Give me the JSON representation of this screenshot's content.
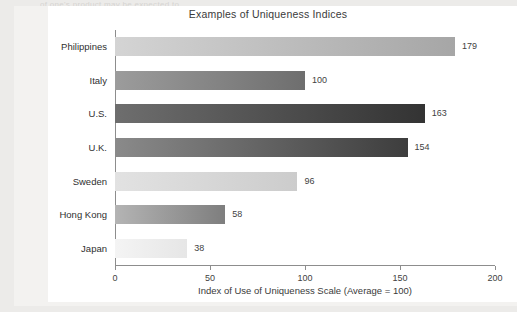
{
  "page": {
    "top_bleed_text": "of one's product may be expected to"
  },
  "chart_data": {
    "type": "bar",
    "orientation": "horizontal",
    "title": "Examples of Uniqueness Indices",
    "xlabel": "Index of Use of Uniqueness Scale (Average = 100)",
    "ylabel": "",
    "categories": [
      "Philippines",
      "Italy",
      "U.S.",
      "U.K.",
      "Sweden",
      "Hong Kong",
      "Japan"
    ],
    "values": [
      179,
      100,
      163,
      154,
      96,
      58,
      38
    ],
    "xlim": [
      0,
      200
    ],
    "xticks": [
      0,
      50,
      100,
      150,
      200
    ],
    "xtick_labels": [
      "0",
      "50",
      "100",
      "150",
      "200"
    ],
    "grid": false,
    "legend": false,
    "bar_colors": [
      {
        "start": "#d4d4d4",
        "end": "#a6a6a6"
      },
      {
        "start": "#9c9c9c",
        "end": "#6e6e6e"
      },
      {
        "start": "#6e6e6e",
        "end": "#333333"
      },
      {
        "start": "#8a8a8a",
        "end": "#3d3d3d"
      },
      {
        "start": "#e2e2e2",
        "end": "#cccccc"
      },
      {
        "start": "#b4b4b4",
        "end": "#7e7e7e"
      },
      {
        "start": "#f4f4f4",
        "end": "#e6e6e6"
      }
    ]
  }
}
